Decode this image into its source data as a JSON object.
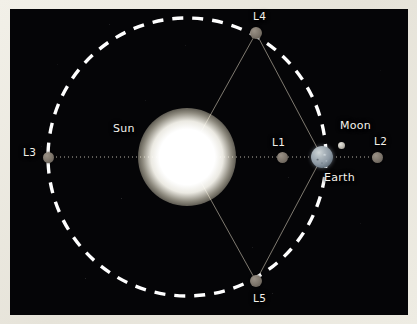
{
  "diagram": {
    "frame_color": "#ece9e0",
    "sky_color": "#050507",
    "orbit_color": "#ffffff",
    "axis_color": "#b9b5ab",
    "connector_color": "#8c877c",
    "label_color": "#f4f2ec"
  },
  "bodies": [
    {
      "id": "sun",
      "label": "Sun",
      "kind": "star",
      "color": "#ffffff",
      "cx": 187,
      "cy": 157,
      "r": 28,
      "label_x": 113,
      "label_y": 122
    },
    {
      "id": "earth",
      "label": "Earth",
      "kind": "planet",
      "color": "#8d99a4",
      "cx": 322,
      "cy": 157,
      "r": 11,
      "label_x": 324,
      "label_y": 171
    },
    {
      "id": "moon",
      "label": "Moon",
      "kind": "moon",
      "color": "#c3c0b8",
      "cx": 341,
      "cy": 145,
      "r": 3.5,
      "label_x": 340,
      "label_y": 119
    }
  ],
  "lagrange_points": [
    {
      "id": "L1",
      "label": "L1",
      "cx": 282,
      "cy": 157,
      "r": 5.5,
      "label_x": 272,
      "label_y": 136
    },
    {
      "id": "L2",
      "label": "L2",
      "cx": 377,
      "cy": 157,
      "r": 5.5,
      "label_x": 374,
      "label_y": 135
    },
    {
      "id": "L3",
      "label": "L3",
      "cx": 48,
      "cy": 157,
      "r": 5.5,
      "label_x": 23,
      "label_y": 146
    },
    {
      "id": "L4",
      "label": "L4",
      "cx": 256,
      "cy": 33,
      "r": 6.0,
      "label_x": 253,
      "label_y": 10
    },
    {
      "id": "L5",
      "label": "L5",
      "cx": 256,
      "cy": 281,
      "r": 6.0,
      "label_x": 253,
      "label_y": 292
    }
  ],
  "orbit": {
    "id": "earth-orbit",
    "shape": "dashed-circle",
    "cx": 187,
    "cy": 157,
    "r": 139,
    "dash": "11 9",
    "stroke_width": 3.4
  },
  "axis": {
    "id": "sun-earth-axis",
    "shape": "dotted-line",
    "x1": 44,
    "y1": 157,
    "x2": 381,
    "y2": 157,
    "dash": "1 3",
    "stroke_width": 1
  },
  "connectors": [
    {
      "id": "sun-to-L4",
      "x1": 187,
      "y1": 157,
      "x2": 256,
      "y2": 33
    },
    {
      "id": "sun-to-L5",
      "x1": 187,
      "y1": 157,
      "x2": 256,
      "y2": 281
    },
    {
      "id": "earth-to-L4",
      "x1": 322,
      "y1": 157,
      "x2": 256,
      "y2": 33
    },
    {
      "id": "earth-to-L5",
      "x1": 322,
      "y1": 157,
      "x2": 256,
      "y2": 281
    }
  ]
}
